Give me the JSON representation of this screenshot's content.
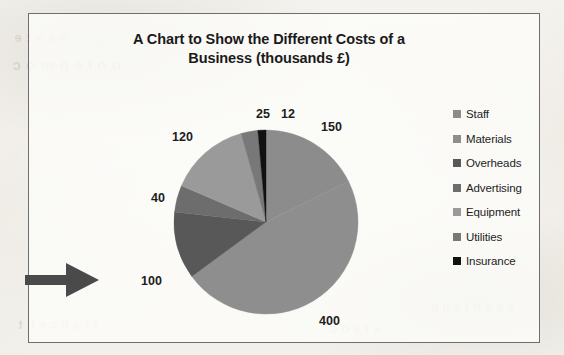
{
  "chart": {
    "title": "A Chart to Show the Different Costs of a Business (thousands £)",
    "title_line_1": "A Chart to Show the Different Costs of a",
    "title_line_2": "Business (thousands £)"
  },
  "legend": {
    "items": [
      {
        "label": "Staff",
        "color": "#8c8c8c"
      },
      {
        "label": "Materials",
        "color": "#8e8e8e"
      },
      {
        "label": "Overheads",
        "color": "#585858"
      },
      {
        "label": "Advertising",
        "color": "#6d6d6d"
      },
      {
        "label": "Equipment",
        "color": "#9a9a9a"
      },
      {
        "label": "Utilities",
        "color": "#787878"
      },
      {
        "label": "Insurance",
        "color": "#111111"
      }
    ]
  },
  "annotation": {
    "arrow_name": "right-pointing-arrow",
    "color": "#4a4a4a"
  },
  "bleed_through": {
    "a": "n  e  s   t   e",
    "b": "u  o  l  e  p  m  o  c",
    "c": "e  n  o  i  t  s  e  u  q",
    "d": "t  r  a  h  c   e  h  t",
    "e": "s  t  s  o  c",
    "f": "s  s  e  n  i  s  u  b"
  },
  "chart_data": {
    "type": "pie",
    "title": "A Chart to Show the Different Costs of a Business (thousands £)",
    "unit": "thousands £",
    "categories": [
      "Staff",
      "Materials",
      "Overheads",
      "Advertising",
      "Equipment",
      "Utilities",
      "Insurance"
    ],
    "values": [
      150,
      400,
      100,
      40,
      120,
      25,
      12
    ],
    "total": 847,
    "colors": [
      "#8c8c8c",
      "#8e8e8e",
      "#585858",
      "#6d6d6d",
      "#9a9a9a",
      "#787878",
      "#111111"
    ],
    "labels_shown": [
      "150",
      "400",
      "100",
      "40",
      "120",
      "25",
      "12"
    ],
    "label_positions": [
      {
        "text": "150",
        "x": 292,
        "y": 106
      },
      {
        "text": "400",
        "x": 290,
        "y": 300
      },
      {
        "text": "100",
        "x": 112,
        "y": 260
      },
      {
        "text": "40",
        "x": 122,
        "y": 177
      },
      {
        "text": "120",
        "x": 143,
        "y": 116
      },
      {
        "text": "25",
        "x": 227,
        "y": 93
      },
      {
        "text": "12",
        "x": 252,
        "y": 93
      }
    ],
    "start_angle_deg": 0,
    "direction": "clockwise",
    "legend_position": "right",
    "grid": false,
    "center": {
      "x": 237,
      "y": 208
    },
    "radius": 92
  }
}
